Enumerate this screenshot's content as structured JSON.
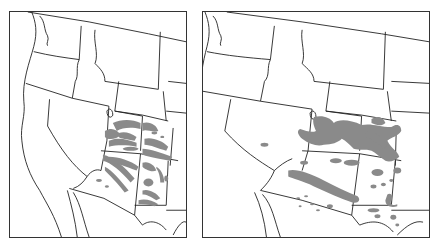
{
  "figure": {
    "panels": [
      {
        "id": "left",
        "description": "Western United States map with dense fine-grained gray shaded pattern over Utah, Colorado, Arizona and New Mexico (Four Corners region)"
      },
      {
        "id": "right",
        "description": "Western United States map with broader, smoother gray shaded bands centered on Utah/Colorado and streaks across Arizona/New Mexico"
      }
    ],
    "colors": {
      "shade": "#8a8a8a",
      "border": "#222222",
      "background": "#ffffff"
    }
  }
}
